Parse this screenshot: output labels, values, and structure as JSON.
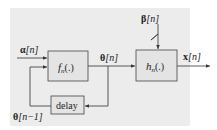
{
  "diagram": {
    "type": "block-diagram",
    "background_color": "#ececec",
    "box_fill": "#e4e4e4",
    "line_color": "#333333",
    "blocks": [
      {
        "id": "f",
        "label_main": "f",
        "label_sub": "n",
        "label_args": "(.)"
      },
      {
        "id": "h",
        "label_main": "h",
        "label_sub": "n",
        "label_args": "(.)"
      },
      {
        "id": "delay",
        "label": "delay"
      }
    ],
    "signals": {
      "alpha": {
        "symbol": "α",
        "index": "[n]"
      },
      "theta": {
        "symbol": "θ",
        "index": "[n]"
      },
      "theta_prev": {
        "symbol": "θ",
        "index": "[n−1]"
      },
      "beta": {
        "symbol": "β",
        "index": "[n]"
      },
      "x": {
        "symbol": "x",
        "index": "[n]"
      }
    },
    "edges": [
      {
        "from": "alpha (input)",
        "to": "f"
      },
      {
        "from": "f",
        "to": "h",
        "label": "θ[n]"
      },
      {
        "from": "θ[n] branch",
        "to": "delay"
      },
      {
        "from": "delay",
        "to": "f",
        "label": "θ[n−1]"
      },
      {
        "from": "beta (input)",
        "to": "h"
      },
      {
        "from": "h",
        "to": "x (output)"
      }
    ]
  }
}
